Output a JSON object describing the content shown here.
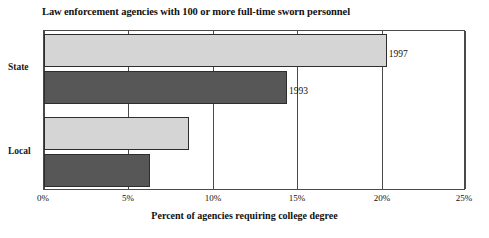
{
  "chart_data": {
    "type": "bar",
    "orientation": "horizontal",
    "title": "Law enforcement agencies with 100 or more full-time sworn personnel",
    "xlabel": "Percent of agencies requiring college degree",
    "ylabel": "",
    "categories": [
      "State",
      "Local"
    ],
    "series": [
      {
        "name": "1997",
        "values": [
          20.3,
          8.6
        ],
        "color": "#d5d5d5"
      },
      {
        "name": "1993",
        "values": [
          14.4,
          6.3
        ],
        "color": "#575757"
      }
    ],
    "bars": [
      {
        "category": "State",
        "series": "1997",
        "value": 20.3,
        "label": "1997",
        "style": "light"
      },
      {
        "category": "State",
        "series": "1993",
        "value": 14.4,
        "label": "1993",
        "style": "dark"
      },
      {
        "category": "Local",
        "series": "1997",
        "value": 8.6,
        "label": "",
        "style": "light"
      },
      {
        "category": "Local",
        "series": "1993",
        "value": 6.3,
        "label": "",
        "style": "dark"
      }
    ],
    "xlim": [
      0,
      25
    ],
    "xticks": [
      0,
      5,
      10,
      15,
      20,
      25
    ],
    "xtick_labels": [
      "0%",
      "5%",
      "10%",
      "15%",
      "20%",
      "25%"
    ],
    "grid": true,
    "grid_axis": "x",
    "legend": "none",
    "data_labels": [
      "1997",
      "1993"
    ]
  },
  "axis": {
    "tick_0": "0%",
    "tick_1": "5%",
    "tick_2": "10%",
    "tick_3": "15%",
    "tick_4": "20%",
    "tick_5": "25%"
  },
  "labels": {
    "cat_state": "State",
    "cat_local": "Local",
    "bar_state_1997": "1997",
    "bar_state_1993": "1993"
  }
}
